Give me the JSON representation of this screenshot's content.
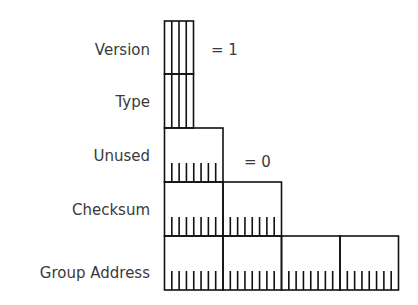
{
  "diagram": {
    "type": "packet-header-layout",
    "fields": [
      {
        "label": "Version",
        "bits": 4,
        "annotation": "= 1"
      },
      {
        "label": "Type",
        "bits": 4
      },
      {
        "label": "Unused",
        "bits": 8,
        "annotation": "= 0"
      },
      {
        "label": "Checksum",
        "bits": 16
      },
      {
        "label": "Group Address",
        "bits": 32
      }
    ]
  }
}
